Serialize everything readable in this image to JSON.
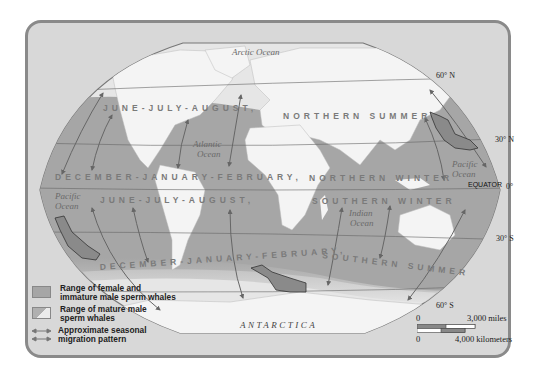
{
  "oceans": {
    "arctic": "Arctic Ocean",
    "atlantic_1": "Atlantic",
    "atlantic_2": "Ocean",
    "pacific_ne_1": "Pacific",
    "pacific_ne_2": "Ocean",
    "pacific_w_1": "Pacific",
    "pacific_w_2": "Ocean",
    "indian_1": "Indian",
    "indian_2": "Ocean"
  },
  "continents": {
    "antarctica": "ANTARCTICA"
  },
  "seasons": {
    "north_summer_a": "JUNE-JULY-AUGUST,",
    "north_summer_b": "NORTHERN SUMMER",
    "north_winter_a": "DECEMBER-JANUARY-FEBRUARY,",
    "north_winter_b": "NORTHERN WINTER",
    "south_winter_a": "JUNE-JULY-AUGUST,",
    "south_winter_b": "SOUTHERN WINTER",
    "south_summer_a": "DECEMBER-JANUARY-FEBRUARY,",
    "south_summer_b": "SOUTHERN SUMMER"
  },
  "latitudes": {
    "n60": "60° N",
    "n30": "30° N",
    "equator": "EQUATOR",
    "zero": "0°",
    "s30": "30° S",
    "s60": "60° S"
  },
  "legend": {
    "items": [
      {
        "line1": "Range of female and",
        "line2": "immature male sperm whales"
      },
      {
        "line1": "Range of mature male",
        "line2": "sperm whales"
      },
      {
        "line1": "Approximate seasonal",
        "line2": "migration pattern"
      }
    ]
  },
  "scale": {
    "zero_top": "0",
    "miles": "3,000 miles",
    "zero_bottom": "0",
    "km": "4,000 kilometers"
  },
  "colors": {
    "frame_bg": "#d8d8d8",
    "frame_border": "#8a8a8a",
    "ocean_range": "#a6a6a6",
    "land": "#f4f4f4",
    "arrow": "#6a6a6a"
  }
}
